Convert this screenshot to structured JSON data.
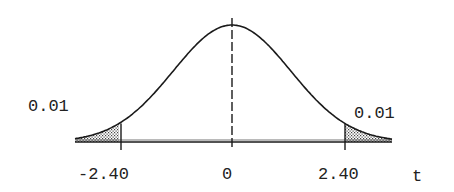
{
  "chart_data": {
    "type": "area",
    "title": "",
    "xlabel": "t",
    "ylabel": "",
    "x_ticks": [
      "-2.40",
      "0",
      "2.40"
    ],
    "critical_values": [
      -2.4,
      2.4
    ],
    "center": 0,
    "tail_areas": [
      {
        "side": "left",
        "region": "t < -2.40",
        "area": 0.01,
        "label": "0.01"
      },
      {
        "side": "right",
        "region": "t > 2.40",
        "area": 0.01,
        "label": "0.01"
      }
    ],
    "grid": false,
    "shading": "dotted"
  },
  "labels": {
    "left_tail": "0.01",
    "right_tail": "0.01",
    "tick_left": "-2.40",
    "tick_center": "0",
    "tick_right": "2.40",
    "axis_var": "t"
  },
  "colors": {
    "line": "#1a1a1a",
    "shade": "#555555",
    "background": "#ffffff"
  }
}
